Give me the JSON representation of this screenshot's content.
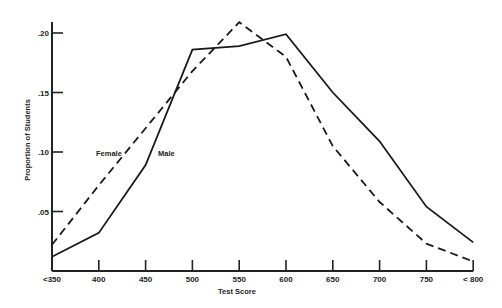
{
  "chart_data": {
    "type": "line",
    "title": "",
    "xlabel": "Test Score",
    "ylabel": "Proportion of Students",
    "x": [
      350,
      400,
      450,
      500,
      550,
      600,
      650,
      700,
      750,
      800
    ],
    "x_tick_labels": [
      "<350",
      "400",
      "450",
      "500",
      "550",
      "600",
      "650",
      "700",
      "750",
      "< 800"
    ],
    "y_ticks": [
      0.05,
      0.1,
      0.15,
      0.2
    ],
    "y_tick_labels": [
      ".05",
      ".10",
      ".15",
      ".20"
    ],
    "ylim": [
      0,
      0.215
    ],
    "grid": false,
    "legend": "inline labels",
    "series": [
      {
        "name": "Female",
        "style": "dashed",
        "values": [
          0.022,
          0.072,
          0.12,
          0.168,
          0.209,
          0.18,
          0.105,
          0.058,
          0.023,
          0.008
        ]
      },
      {
        "name": "Male",
        "style": "solid",
        "values": [
          0.012,
          0.032,
          0.089,
          0.186,
          0.189,
          0.199,
          0.15,
          0.109,
          0.054,
          0.024
        ]
      }
    ],
    "annotations": [
      {
        "text": "Female",
        "series": "Female"
      },
      {
        "text": "Male",
        "series": "Male"
      }
    ]
  }
}
